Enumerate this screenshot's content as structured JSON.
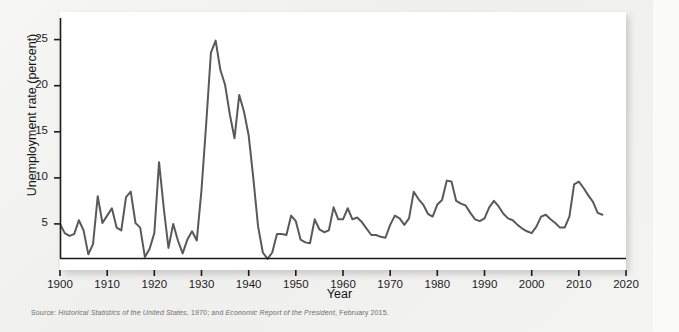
{
  "figure": {
    "source_prefix": "Source:",
    "source_work_1": "Historical Statistics of the United States",
    "source_mid": ", 1970; and ",
    "source_work_2": "Economic Report of the President",
    "source_suffix": ", February 2015.",
    "panel_background": "#ffffff",
    "page_background": "#f2f2f1",
    "line_color": "#595959",
    "axis_color": "#1b1b1b"
  },
  "chart_data": {
    "type": "line",
    "title": "",
    "xlabel": "Year",
    "ylabel": "Unemployment rate (percent)",
    "xlim": [
      1900,
      2020
    ],
    "ylim": [
      0,
      28
    ],
    "grid": false,
    "legend": null,
    "xticks": [
      1900,
      1910,
      1920,
      1930,
      1940,
      1950,
      1960,
      1970,
      1980,
      1990,
      2000,
      2010,
      2020
    ],
    "yticks": [
      5,
      10,
      15,
      20,
      25
    ],
    "series": [
      {
        "name": "Unemployment rate",
        "color": "#595959",
        "x": [
          1900,
          1901,
          1902,
          1903,
          1904,
          1905,
          1906,
          1907,
          1908,
          1909,
          1910,
          1911,
          1912,
          1913,
          1914,
          1915,
          1916,
          1917,
          1918,
          1919,
          1920,
          1921,
          1922,
          1923,
          1924,
          1925,
          1926,
          1927,
          1928,
          1929,
          1930,
          1931,
          1932,
          1933,
          1934,
          1935,
          1936,
          1937,
          1938,
          1939,
          1940,
          1941,
          1942,
          1943,
          1944,
          1945,
          1946,
          1947,
          1948,
          1949,
          1950,
          1951,
          1952,
          1953,
          1954,
          1955,
          1956,
          1957,
          1958,
          1959,
          1960,
          1961,
          1962,
          1963,
          1964,
          1965,
          1966,
          1967,
          1968,
          1969,
          1970,
          1971,
          1972,
          1973,
          1974,
          1975,
          1976,
          1977,
          1978,
          1979,
          1980,
          1981,
          1982,
          1983,
          1984,
          1985,
          1986,
          1987,
          1988,
          1989,
          1990,
          1991,
          1992,
          1993,
          1994,
          1995,
          1996,
          1997,
          1998,
          1999,
          2000,
          2001,
          2002,
          2003,
          2004,
          2005,
          2006,
          2007,
          2008,
          2009,
          2010,
          2011,
          2012,
          2013,
          2014,
          2015
        ],
        "values": [
          5.0,
          4.0,
          3.7,
          3.9,
          5.4,
          4.3,
          1.7,
          2.8,
          8.0,
          5.1,
          5.9,
          6.7,
          4.6,
          4.3,
          7.9,
          8.5,
          5.1,
          4.6,
          1.4,
          2.3,
          4.0,
          11.7,
          6.7,
          2.4,
          5.0,
          3.2,
          1.8,
          3.3,
          4.2,
          3.2,
          8.7,
          15.9,
          23.6,
          24.9,
          21.7,
          20.1,
          16.9,
          14.3,
          19.0,
          17.2,
          14.6,
          9.9,
          4.7,
          1.9,
          1.2,
          1.9,
          3.9,
          3.9,
          3.8,
          5.9,
          5.3,
          3.3,
          3.0,
          2.9,
          5.5,
          4.4,
          4.1,
          4.3,
          6.8,
          5.5,
          5.5,
          6.7,
          5.5,
          5.7,
          5.2,
          4.5,
          3.8,
          3.8,
          3.6,
          3.5,
          4.9,
          5.9,
          5.6,
          4.9,
          5.6,
          8.5,
          7.7,
          7.1,
          6.1,
          5.8,
          7.1,
          7.6,
          9.7,
          9.6,
          7.5,
          7.2,
          7.0,
          6.2,
          5.5,
          5.3,
          5.6,
          6.8,
          7.5,
          6.9,
          6.1,
          5.6,
          5.4,
          4.9,
          4.5,
          4.2,
          4.0,
          4.7,
          5.8,
          6.0,
          5.5,
          5.1,
          4.6,
          4.6,
          5.8,
          9.3,
          9.6,
          8.9,
          8.1,
          7.4,
          6.2,
          6.0
        ]
      }
    ]
  }
}
